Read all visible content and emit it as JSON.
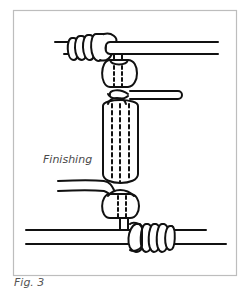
{
  "figure": {
    "label": "Finishing",
    "caption": "Fig. 3"
  },
  "colors": {
    "frame": "#bdbdbd",
    "ink": "#111111",
    "label_text": "#4a4a4a",
    "background": "#ffffff"
  }
}
